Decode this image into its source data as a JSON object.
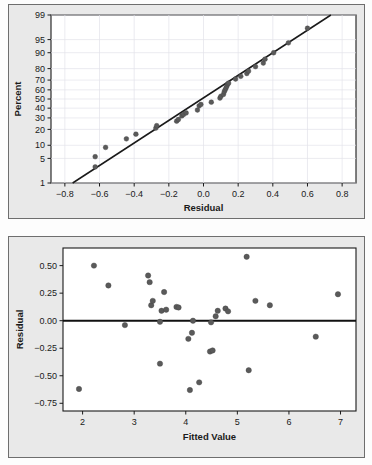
{
  "figure": {
    "background_color": "#e9e9e9",
    "frame_color": "#6e6e6e",
    "marker_color": "#5a5a5a",
    "line_color": "#1a1a1a",
    "grid_color": "#e2e2ea"
  },
  "panels": [
    {
      "name": "normal-probability-plot",
      "title": ""
    },
    {
      "name": "residuals-versus-fits-plot",
      "title": ""
    }
  ],
  "chart_data": [
    {
      "type": "scatter",
      "name": "normal-probability-plot",
      "title": "",
      "xlabel": "Residual",
      "ylabel": "Percent",
      "xlim": [
        -0.88,
        0.88
      ],
      "ylim_percent": [
        1,
        99
      ],
      "xticks": [
        -0.8,
        -0.6,
        -0.4,
        -0.2,
        0.0,
        0.2,
        0.4,
        0.6,
        0.8
      ],
      "xticklabels": [
        "-0.8",
        "-0.6",
        "-0.4",
        "-0.2",
        "0.0",
        "0.2",
        "0.4",
        "0.6",
        "0.8"
      ],
      "yticks": [
        1,
        5,
        10,
        20,
        30,
        40,
        50,
        60,
        70,
        80,
        90,
        95,
        99
      ],
      "yticklabels": [
        "1",
        "5",
        "10",
        "20",
        "30",
        "40",
        "50",
        "60",
        "70",
        "80",
        "90",
        "95",
        "99"
      ],
      "y_scale": "normal-probability",
      "grid": true,
      "legend": "none",
      "reference_line": {
        "x1": -0.755,
        "y1": 1,
        "x2": 0.735,
        "y2": 99
      },
      "x": [
        -0.625,
        -0.625,
        -0.565,
        -0.445,
        -0.39,
        -0.275,
        -0.27,
        -0.155,
        -0.145,
        -0.125,
        -0.115,
        -0.1,
        -0.035,
        -0.025,
        -0.015,
        0.045,
        0.095,
        0.1,
        0.115,
        0.12,
        0.125,
        0.13,
        0.135,
        0.14,
        0.145,
        0.185,
        0.215,
        0.25,
        0.26,
        0.3,
        0.345,
        0.355,
        0.405,
        0.49,
        0.6
      ],
      "y": [
        3,
        5.5,
        9,
        13.5,
        16.5,
        21,
        23,
        27,
        28.5,
        32,
        33.5,
        35,
        38,
        42.5,
        44,
        46.5,
        51,
        53,
        55,
        58,
        60,
        62,
        64,
        66,
        67,
        71,
        73.5,
        76,
        78,
        81.5,
        84,
        86.5,
        90,
        94,
        97.5
      ]
    },
    {
      "type": "scatter",
      "name": "residuals-versus-fits-plot",
      "title": "",
      "xlabel": "Fitted Value",
      "ylabel": "Residual",
      "xlim": [
        1.62,
        7.3
      ],
      "ylim": [
        -0.82,
        0.66
      ],
      "xticks": [
        2,
        3,
        4,
        5,
        6,
        7
      ],
      "xticklabels": [
        "2",
        "3",
        "4",
        "5",
        "6",
        "7"
      ],
      "yticks": [
        0.5,
        0.25,
        0.0,
        -0.25,
        -0.5,
        -0.75
      ],
      "yticklabels": [
        "0.50",
        "0.25",
        "0.00",
        "-0.25",
        "-0.50",
        "-0.75"
      ],
      "grid": false,
      "legend": "none",
      "reference_line": {
        "y": 0.0
      },
      "x": [
        1.93,
        2.22,
        2.5,
        2.82,
        3.27,
        3.3,
        3.33,
        3.36,
        3.5,
        3.5,
        3.53,
        3.58,
        3.62,
        3.82,
        3.86,
        4.05,
        4.08,
        4.12,
        4.14,
        4.26,
        4.47,
        4.49,
        4.52,
        4.58,
        4.62,
        4.77,
        4.82,
        5.18,
        5.22,
        5.35,
        5.63,
        6.52,
        6.95
      ],
      "y": [
        -0.62,
        0.5,
        0.32,
        -0.04,
        0.41,
        0.35,
        0.14,
        0.18,
        -0.01,
        -0.39,
        0.09,
        0.26,
        0.1,
        0.125,
        0.12,
        -0.165,
        -0.63,
        -0.11,
        0.0,
        -0.56,
        -0.28,
        -0.015,
        -0.27,
        0.04,
        0.09,
        0.11,
        0.085,
        0.58,
        -0.45,
        0.18,
        0.14,
        -0.145,
        0.24
      ]
    }
  ]
}
